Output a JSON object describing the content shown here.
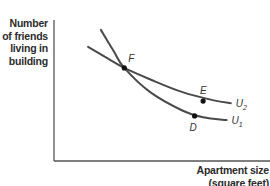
{
  "chart_data": {
    "type": "line",
    "title": "",
    "xlabel": "Apartment size (square feet)",
    "ylabel": "Number of friends living in building",
    "ylabel_lines": [
      "Number",
      "of friends",
      "living in",
      "building"
    ],
    "xlabel_lines": [
      "Apartment size",
      "(square feet)"
    ],
    "xlim": [
      0,
      10
    ],
    "ylim": [
      0,
      10
    ],
    "grid": false,
    "ticks": "none",
    "series": [
      {
        "name": "U2",
        "label_main": "U",
        "label_sub": "2",
        "x": [
          1.6,
          2.5,
          3.3,
          4.5,
          6.0,
          7.5,
          8.3
        ],
        "y": [
          8.1,
          7.3,
          6.6,
          5.8,
          4.9,
          4.3,
          4.1
        ]
      },
      {
        "name": "U1",
        "label_main": "U",
        "label_sub": "1",
        "x": [
          2.2,
          2.8,
          3.3,
          4.5,
          6.0,
          7.0,
          8.1
        ],
        "y": [
          9.3,
          7.8,
          6.6,
          4.9,
          3.6,
          3.1,
          2.9
        ]
      }
    ],
    "points": [
      {
        "label": "F",
        "x": 3.3,
        "y": 6.6
      },
      {
        "label": "E",
        "x": 7.0,
        "y": 4.25
      },
      {
        "label": "D",
        "x": 6.6,
        "y": 3.2
      }
    ]
  }
}
